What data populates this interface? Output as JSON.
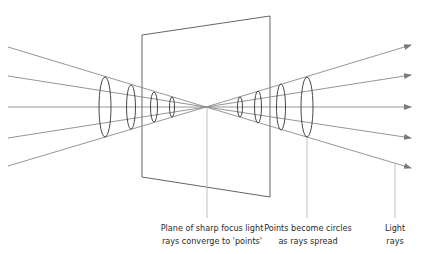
{
  "diagram": {
    "colors": {
      "ray": "#8a8a8a",
      "plane": "#555555",
      "ellipse": "#333333",
      "leader": "#b0b0b0",
      "text": "#2a2a2a"
    },
    "plane": {
      "top_left": [
        142,
        35
      ],
      "top_right": [
        270,
        16
      ],
      "bottom_right": [
        270,
        197
      ],
      "bottom_left": [
        142,
        177
      ]
    },
    "focal_point": [
      206,
      107
    ],
    "rays": [
      {
        "start": [
          8,
          47
        ],
        "end": [
          411,
          45
        ]
      },
      {
        "start": [
          8,
          76
        ],
        "end": [
          411,
          75
        ]
      },
      {
        "start": [
          8,
          107
        ],
        "end": [
          411,
          107
        ]
      },
      {
        "start": [
          8,
          138
        ],
        "end": [
          411,
          138
        ]
      },
      {
        "start": [
          8,
          166
        ],
        "end": [
          411,
          168
        ]
      }
    ],
    "ellipses_before_focus": [
      {
        "cx": 105,
        "cy": 107,
        "rx": 6,
        "ry": 30
      },
      {
        "cx": 131,
        "cy": 107,
        "rx": 4.5,
        "ry": 22
      },
      {
        "cx": 154,
        "cy": 107,
        "rx": 3.5,
        "ry": 15
      },
      {
        "cx": 172,
        "cy": 107,
        "rx": 2.5,
        "ry": 10
      }
    ],
    "ellipses_after_focus": [
      {
        "cx": 240,
        "cy": 107,
        "rx": 2.5,
        "ry": 10
      },
      {
        "cx": 258,
        "cy": 107,
        "rx": 3.5,
        "ry": 16
      },
      {
        "cx": 281,
        "cy": 107,
        "rx": 4.5,
        "ry": 23
      },
      {
        "cx": 307,
        "cy": 107,
        "rx": 6,
        "ry": 30
      }
    ],
    "leaders": [
      {
        "from": [
          207,
          107
        ],
        "to": [
          207,
          218
        ]
      },
      {
        "from": [
          307,
          137
        ],
        "to": [
          307,
          218
        ]
      },
      {
        "from": [
          395,
          164
        ],
        "to": [
          395,
          218
        ]
      }
    ],
    "labels": [
      {
        "id": "plane-label",
        "x": 212,
        "y": 222,
        "lines": [
          "Plane of sharp focus light",
          "rays converge to 'points'"
        ]
      },
      {
        "id": "circles-label",
        "x": 308,
        "y": 222,
        "lines": [
          "Points become circles",
          "as rays spread"
        ]
      },
      {
        "id": "rays-label",
        "x": 395,
        "y": 222,
        "lines": [
          "Light",
          "rays"
        ]
      }
    ]
  }
}
